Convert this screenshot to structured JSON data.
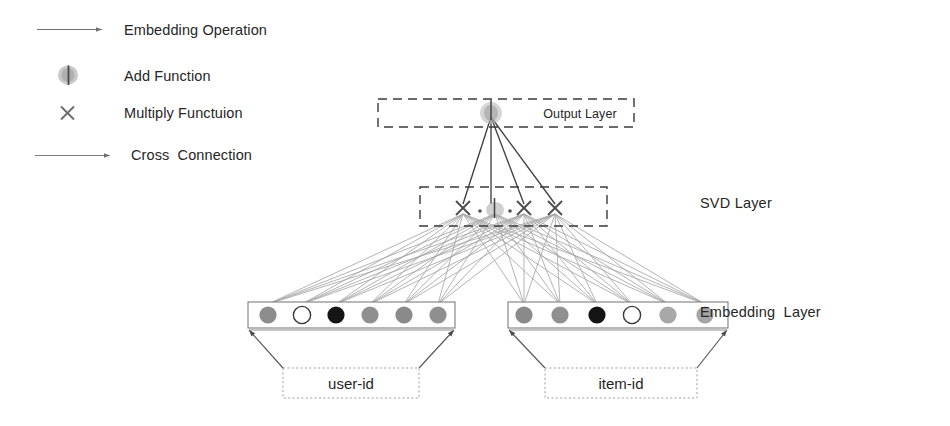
{
  "figure": {
    "type": "diagram",
    "title": "",
    "background": "#ffffff",
    "width": 950,
    "height": 426
  },
  "legend": {
    "items": [
      {
        "id": "embedding-operation",
        "label": "Embedding Operation",
        "icon": "thin-arrow-icon",
        "color": "#6f6f6f"
      },
      {
        "id": "add-function",
        "label": "Add Function",
        "icon": "add-node-icon",
        "color": "#9a9a9a"
      },
      {
        "id": "multiply-function",
        "label": "Multiply Functuion",
        "icon": "multiply-x-icon",
        "color": "#7a7a7a"
      },
      {
        "id": "cross-connection",
        "label": "Cross  Connection",
        "icon": "long-arrow-icon",
        "color": "#8a8a8a"
      }
    ]
  },
  "layers": {
    "output": {
      "name": "Output Layer",
      "label": "Output Layer",
      "node": {
        "type": "add-function",
        "x": 491,
        "y": 114,
        "color": "#a8a8a8"
      },
      "box": {
        "x": 378,
        "y": 99,
        "width": 256,
        "height": 28,
        "stroke": "#3a3a3a",
        "style": "dashed"
      }
    },
    "svd": {
      "name": "SVD Layer",
      "label": "SVD Layer",
      "label_x": 700,
      "label_y": 196,
      "box": {
        "x": 420,
        "y": 187,
        "width": 187,
        "height": 39,
        "stroke": "#3a3a3a",
        "style": "dashed"
      },
      "nodes": [
        {
          "type": "multiply",
          "x": 463,
          "y": 208,
          "symbol": "x"
        },
        {
          "type": "ellipsis-dot",
          "x": 480,
          "y": 211,
          "symbol": "."
        },
        {
          "type": "add",
          "x": 495,
          "y": 209,
          "symbol": "add"
        },
        {
          "type": "ellipsis-dot",
          "x": 509,
          "y": 211,
          "symbol": "."
        },
        {
          "type": "multiply",
          "x": 524,
          "y": 208,
          "symbol": "x"
        },
        {
          "type": "multiply",
          "x": 555,
          "y": 208,
          "symbol": "x"
        }
      ]
    },
    "embedding": {
      "name": "Embedding Layer",
      "label": "Embedding  Layer",
      "label_x": 700,
      "label_y": 305,
      "groups": [
        {
          "id": "user-embedding",
          "input_label": "user-id",
          "box": {
            "x": 248,
            "y": 302,
            "width": 207,
            "height": 26
          },
          "input_box": {
            "x": 283,
            "y": 368,
            "width": 136,
            "height": 30
          },
          "circles": [
            {
              "index": 0,
              "x": 268,
              "fill": "#8c8c8c",
              "kind": "gray"
            },
            {
              "index": 1,
              "x": 302,
              "fill": "#ffffff",
              "kind": "empty"
            },
            {
              "index": 2,
              "x": 336,
              "fill": "#151515",
              "kind": "black"
            },
            {
              "index": 3,
              "x": 370,
              "fill": "#8f8f8f",
              "kind": "gray"
            },
            {
              "index": 4,
              "x": 404,
              "fill": "#8a8a8a",
              "kind": "gray"
            },
            {
              "index": 5,
              "x": 438,
              "fill": "#8f8f8f",
              "kind": "gray"
            }
          ]
        },
        {
          "id": "item-embedding",
          "input_label": "item-id",
          "box": {
            "x": 508,
            "y": 302,
            "width": 220,
            "height": 26
          },
          "input_box": {
            "x": 545,
            "y": 368,
            "width": 152,
            "height": 30
          },
          "circles": [
            {
              "index": 0,
              "x": 524,
              "fill": "#8a8a8a",
              "kind": "gray"
            },
            {
              "index": 1,
              "x": 560,
              "fill": "#909090",
              "kind": "gray"
            },
            {
              "index": 2,
              "x": 597,
              "fill": "#141414",
              "kind": "black"
            },
            {
              "index": 3,
              "x": 632,
              "fill": "#ffffff",
              "kind": "empty"
            },
            {
              "index": 4,
              "x": 668,
              "fill": "#a8a8a8",
              "kind": "light-gray"
            },
            {
              "index": 5,
              "x": 705,
              "fill": "#a6a6a6",
              "kind": "light-gray"
            }
          ]
        }
      ]
    }
  },
  "connections": {
    "output_to_svd": {
      "description": "four dark lines from SVD nodes converging to output add node",
      "color": "#3f3f3f",
      "count": 4
    },
    "svd_to_embedding": {
      "description": "dense gray cross connections from every embedding circle to every SVD node",
      "color": "#9b9b9b"
    },
    "input_to_embedding": {
      "description": "trapezoid arrows from input id boxes up to embedding boxes",
      "color": "#5a5a5a"
    }
  },
  "colors": {
    "line_dark": "#3f3f3f",
    "line_gray": "#9b9b9b",
    "box_stroke": "#6a6a6a",
    "dashed_stroke": "#3a3a3a",
    "dotted_stroke": "#a0a0a0",
    "text": "#262626"
  }
}
